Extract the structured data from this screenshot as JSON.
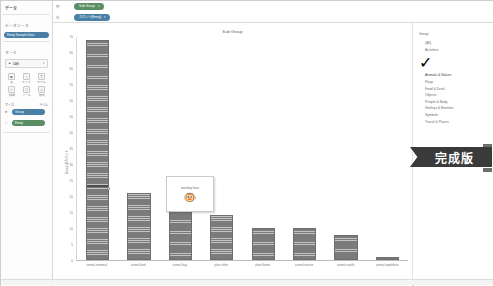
{
  "left_pane": {
    "title": "データ",
    "source_section_label": "データソース",
    "source_pill": "Emoji Sample Data",
    "marks_section_label": "マーク",
    "marks_type": "自動",
    "mark_tools": [
      {
        "name": "color",
        "label": "色",
        "glyph": "■"
      },
      {
        "name": "size",
        "label": "サイズ",
        "glyph": "↕"
      },
      {
        "name": "label",
        "label": "ラベル",
        "glyph": "T"
      },
      {
        "name": "detail",
        "label": "詳細",
        "glyph": "○"
      },
      {
        "name": "tooltip",
        "label": "ツール",
        "glyph": "□"
      },
      {
        "name": "shape",
        "label": "形状",
        "glyph": "◇"
      }
    ],
    "shelf_labels": {
      "left": "サイズ",
      "right": "ラベル"
    },
    "field_pills": [
      {
        "label": "Group",
        "color": "blue"
      },
      {
        "label": "Emoji",
        "color": "green"
      }
    ]
  },
  "shelves": {
    "columns_label": "列",
    "rows_label": "行",
    "columns_pills": [
      {
        "label": "Sub Group",
        "caret": "▾",
        "color": "green"
      }
    ],
    "rows_pills": [
      {
        "label": "カウント(Emoji)",
        "caret": "▾",
        "color": "blue"
      }
    ]
  },
  "chart_data": {
    "type": "bar",
    "title": "Sub Group",
    "xlabel": "",
    "ylabel": "Emoji のカウント",
    "categories": [
      "animal-mammal",
      "animal-bird",
      "animal-bug",
      "plant-other",
      "plant-flower",
      "animal-marine",
      "animal-reptile",
      "animal-amphibian"
    ],
    "values": [
      69,
      21,
      17,
      14,
      10,
      10,
      8,
      1
    ],
    "ylim": [
      0,
      70
    ],
    "yticks": [
      0,
      5,
      10,
      15,
      20,
      25,
      30,
      35,
      40,
      45,
      50,
      55,
      60,
      65,
      70
    ],
    "grid": false,
    "bar_color": "#7b7b7b",
    "stacked_marks": true
  },
  "tooltip": {
    "label": "monkey face",
    "emoji": "🐵"
  },
  "legend": {
    "title": "Group",
    "items": [
      {
        "label": "(All)",
        "checked": false
      },
      {
        "label": "Activities",
        "checked": false
      },
      {
        "label": "Animals & Nature",
        "checked": true
      },
      {
        "label": "Flags",
        "checked": false
      },
      {
        "label": "Food & Drink",
        "checked": false
      },
      {
        "label": "Objects",
        "checked": false
      },
      {
        "label": "People & Body",
        "checked": false
      },
      {
        "label": "Smileys & Emotion",
        "checked": false
      },
      {
        "label": "Symbols",
        "checked": false
      },
      {
        "label": "Travel & Places",
        "checked": false
      }
    ],
    "check_glyph": "✓"
  },
  "badge": {
    "text": "完成版"
  },
  "colors": {
    "accent_blue": "#4a7fa5",
    "accent_green": "#5b8f63",
    "bar_gray": "#7b7b7b",
    "ribbon_dark": "#3a3a3a"
  }
}
